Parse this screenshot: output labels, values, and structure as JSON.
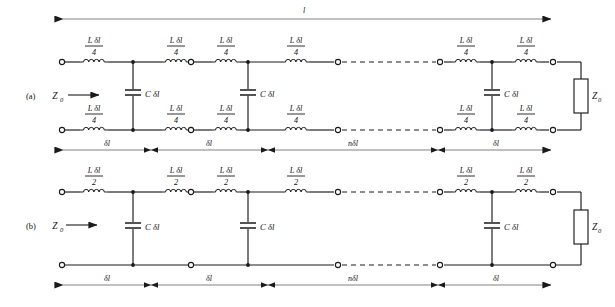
{
  "figure": {
    "type": "circuit-diagram",
    "line_color": "#1a1a1a",
    "background": "#ffffff"
  },
  "panels": [
    {
      "id": "a",
      "label": "(a)",
      "source_impedance": "Z",
      "source_impedance_sub": "0",
      "load_impedance": "Z",
      "load_impedance_sub": "0",
      "series_numerator": "L δl",
      "series_denominator": "4",
      "shunt_label": "C δl",
      "overall_length_label": "l",
      "segment_labels": [
        "δl",
        "δl",
        "nδl",
        "δl"
      ]
    },
    {
      "id": "b",
      "label": "(b)",
      "source_impedance": "Z",
      "source_impedance_sub": "0",
      "load_impedance": "Z",
      "load_impedance_sub": "0",
      "series_numerator": "L δl",
      "series_denominator": "2",
      "shunt_label": "C δl",
      "segment_labels": [
        "δl",
        "δl",
        "nδl",
        "δl"
      ]
    }
  ],
  "symbols": {
    "inductor": "inductor-coil",
    "capacitor": "capacitor-plates",
    "resistor": "resistor-box",
    "terminal": "open-circle-terminal",
    "junction": "filled-node",
    "ellipsis": "dashed-continuation"
  }
}
